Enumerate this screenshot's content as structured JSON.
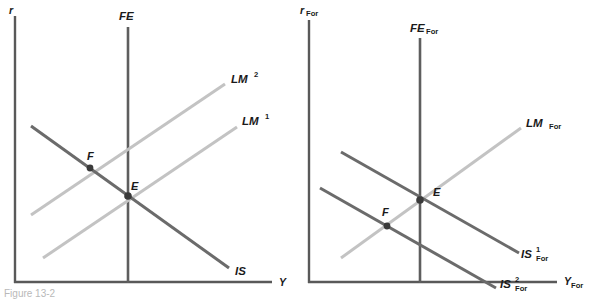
{
  "figure": {
    "caption_partial": "Figure 13-2",
    "background_color": "#ffffff",
    "colors": {
      "axis": "#595959",
      "is_curve": "#6b6b6b",
      "lm_curve": "#c3c3c3",
      "fe_curve": "#5e5e5e",
      "point": "#3a3a3a"
    }
  },
  "panels": [
    {
      "id": "domestic",
      "axes": {
        "y_axis_label": "r",
        "x_axis_label": "Y"
      },
      "curves": [
        {
          "name": "FE",
          "label_base": "FE",
          "label_sup": "",
          "label_sub": "",
          "style": "vertical",
          "color": "#5e5e5e"
        },
        {
          "name": "LM2",
          "label_base": "LM",
          "label_sup": "2",
          "label_sub": "",
          "style": "upward",
          "color": "#c3c3c3"
        },
        {
          "name": "LM1",
          "label_base": "LM",
          "label_sup": "1",
          "label_sub": "",
          "style": "upward",
          "color": "#c3c3c3"
        },
        {
          "name": "IS",
          "label_base": "IS",
          "label_sup": "",
          "label_sub": "",
          "style": "downward",
          "color": "#6b6b6b"
        }
      ],
      "points": [
        {
          "name": "F",
          "label": "F"
        },
        {
          "name": "E",
          "label": "E"
        }
      ]
    },
    {
      "id": "foreign",
      "axes": {
        "y_axis_label_base": "r",
        "y_axis_label_sub": "For",
        "x_axis_label_base": "Y",
        "x_axis_label_sub": "For"
      },
      "curves": [
        {
          "name": "FE_For",
          "label_base": "FE",
          "label_sup": "",
          "label_sub": "For",
          "style": "vertical",
          "color": "#5e5e5e"
        },
        {
          "name": "LM_For",
          "label_base": "LM",
          "label_sup": "",
          "label_sub": "For",
          "style": "upward",
          "color": "#c3c3c3"
        },
        {
          "name": "IS1_For",
          "label_base": "IS",
          "label_sup": "1",
          "label_sub": "For",
          "style": "downward",
          "color": "#6b6b6b"
        },
        {
          "name": "IS2_For",
          "label_base": "IS",
          "label_sup": "2",
          "label_sub": "For",
          "style": "downward",
          "color": "#6b6b6b"
        }
      ],
      "points": [
        {
          "name": "E",
          "label": "E"
        },
        {
          "name": "F",
          "label": "F"
        }
      ]
    }
  ]
}
